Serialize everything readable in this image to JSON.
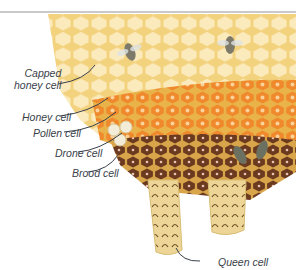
{
  "figure": {
    "labels": [
      {
        "id": "capped-honey-cell",
        "text_line1": "Capped",
        "text_line2": "honey cell"
      },
      {
        "id": "honey-cell",
        "text": "Honey cell"
      },
      {
        "id": "pollen-cell",
        "text": "Pollen cell"
      },
      {
        "id": "drone-cell",
        "text": "Drone cell"
      },
      {
        "id": "brood-cell",
        "text": "Brood cell"
      },
      {
        "id": "queen-cell",
        "text": "Queen cell"
      }
    ],
    "colors": {
      "capped_honey": "#fbe9b8",
      "wax": "#f3d27e",
      "honey": "#f1a33a",
      "pollen": "#e8742a",
      "brood_capped": "#6b3a1f",
      "drone_cap": "#f3ecd8",
      "queen_cell": "#ecd596",
      "label_text": "#3a3f4a"
    }
  }
}
